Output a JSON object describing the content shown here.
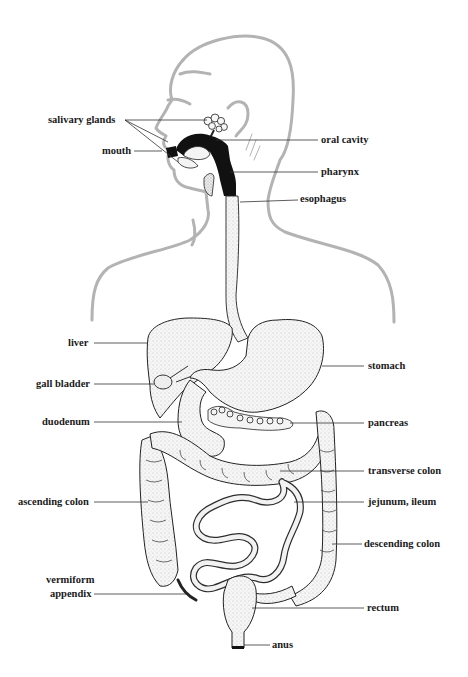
{
  "diagram": {
    "colors": {
      "body_outline": "#b3b3b3",
      "organ_line": "#222222",
      "organ_fill": "#f4f4f4",
      "stipple": "#8a8a8a",
      "dark_tract": "#111111",
      "leader_line": "#333333",
      "label_text": "#1a1a1a"
    },
    "labels": {
      "salivary_glands": "salivary glands",
      "mouth": "mouth",
      "oral_cavity": "oral cavity",
      "pharynx": "pharynx",
      "esophagus": "esophagus",
      "liver": "liver",
      "gall_bladder": "gall bladder",
      "duodenum": "duodenum",
      "stomach": "stomach",
      "pancreas": "pancreas",
      "transverse_colon": "transverse colon",
      "ascending_colon": "ascending colon",
      "jejunum_ileum": "jejunum, ileum",
      "descending_colon": "descending colon",
      "vermiform_appendix_line1": "vermiform",
      "vermiform_appendix_line2": "appendix",
      "rectum": "rectum",
      "anus": "anus"
    }
  }
}
